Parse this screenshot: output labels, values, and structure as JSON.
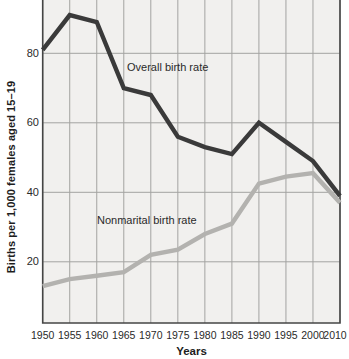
{
  "chart_data": {
    "type": "line",
    "title": "",
    "x": [
      "1950",
      "1955",
      "1960",
      "1965",
      "1970",
      "1975",
      "1980",
      "1985",
      "1990",
      "1995",
      "2000",
      "2010"
    ],
    "series": [
      {
        "name": "Overall birth rate",
        "color": "#3a3a3a",
        "values": [
          81,
          91,
          89,
          70,
          68,
          56,
          53,
          51,
          60,
          54.5,
          49,
          39
        ]
      },
      {
        "name": "Nonmarital birth rate",
        "color": "#b3b2af",
        "values": [
          13,
          15,
          16,
          17,
          22,
          23.5,
          28,
          31,
          42.5,
          44.5,
          45.5,
          37
        ]
      }
    ],
    "xlabel": "Years",
    "ylabel": "Births per 1,000 females aged 15–19",
    "yticks": [
      20,
      40,
      60,
      80
    ],
    "ylim": [
      2.3,
      95.4
    ],
    "grid": true,
    "legend_position": "inline-annotations",
    "note_top_cropped": "plot area is cut off at top of image above ~95"
  },
  "colors": {
    "plot_background": "#f1f0ee",
    "gridline": "#a3a3a1",
    "axis_border": "#454545",
    "text": "#1f1f1f"
  }
}
